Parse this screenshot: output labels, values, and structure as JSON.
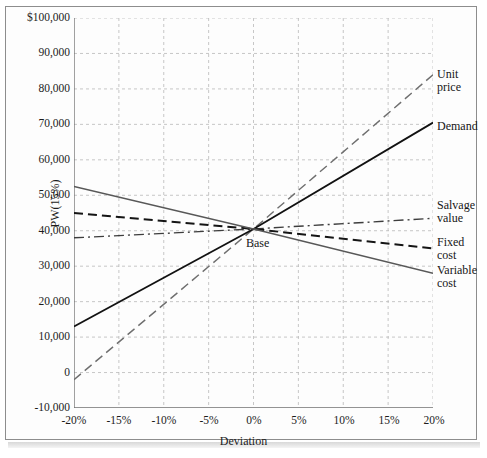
{
  "chart_data": {
    "type": "line",
    "title": "",
    "xlabel": "Deviation",
    "ylabel": "PW(15%)",
    "xlim": [
      -20,
      20
    ],
    "ylim": [
      -10000,
      100000
    ],
    "grid": true,
    "legend_position": "right-of-plot",
    "x_tick_labels": [
      "-20%",
      "-15%",
      "-10%",
      "-5%",
      "0%",
      "5%",
      "10%",
      "15%",
      "20%"
    ],
    "x_tick_values": [
      -20,
      -15,
      -10,
      -5,
      0,
      5,
      10,
      15,
      20
    ],
    "y_tick_labels": [
      "$100,000",
      "90,000",
      "80,000",
      "70,000",
      "60,000",
      "50,000",
      "40,000",
      "30,000",
      "20,000",
      "10,000",
      "0",
      "-10,000"
    ],
    "y_tick_values": [
      100000,
      90000,
      80000,
      70000,
      60000,
      50000,
      40000,
      30000,
      20000,
      10000,
      0,
      -10000
    ],
    "base_point": {
      "label": "Base",
      "x": 0,
      "y": 40500
    },
    "series": [
      {
        "name": "Unit price",
        "label_lines": [
          "Unit",
          "price"
        ],
        "style": "dashed",
        "color": "#6e6e6e",
        "x": [
          -20,
          0,
          20
        ],
        "values": [
          -2000,
          40500,
          84000
        ]
      },
      {
        "name": "Demand",
        "label_lines": [
          "Demand"
        ],
        "style": "solid",
        "color": "#121212",
        "x": [
          -20,
          0,
          20
        ],
        "values": [
          13000,
          40500,
          70500
        ]
      },
      {
        "name": "Salvage value",
        "label_lines": [
          "Salvage",
          "value"
        ],
        "style": "dash-dot",
        "color": "#3d3d3d",
        "x": [
          -20,
          0,
          20
        ],
        "values": [
          38000,
          40500,
          43500
        ]
      },
      {
        "name": "Fixed cost",
        "label_lines": [
          "Fixed",
          "cost"
        ],
        "style": "dashed",
        "color": "#151515",
        "x": [
          -20,
          0,
          20
        ],
        "values": [
          45000,
          40500,
          35000
        ]
      },
      {
        "name": "Variable cost",
        "label_lines": [
          "Variable",
          "cost"
        ],
        "style": "solid",
        "color": "#585858",
        "x": [
          -20,
          0,
          20
        ],
        "values": [
          52500,
          40500,
          28000
        ]
      }
    ]
  }
}
